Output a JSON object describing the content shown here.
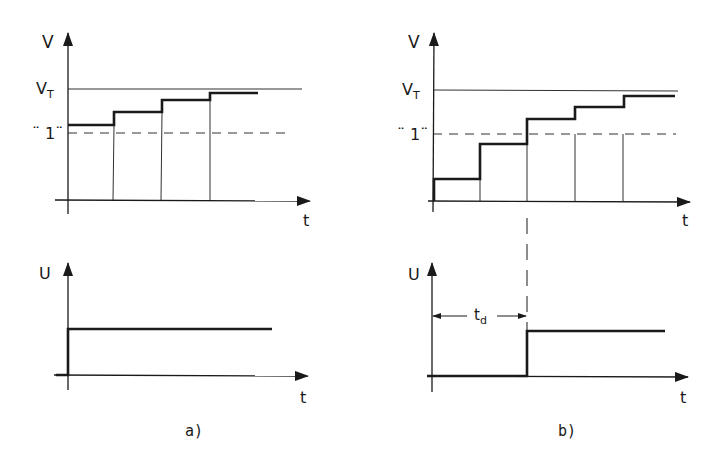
{
  "figure": {
    "caption_a": "a)",
    "caption_b": "b)"
  },
  "panel_a": {
    "top": {
      "y_axis_label": "V",
      "x_axis_label": "t",
      "threshold_label": "V",
      "threshold_sub": "T",
      "logic_level_label": "¨ 1¨",
      "steps": [
        {
          "x_start": 68,
          "x_end": 114,
          "level": 125
        },
        {
          "x_start": 114,
          "x_end": 162,
          "level": 112
        },
        {
          "x_start": 162,
          "x_end": 210,
          "level": 100
        },
        {
          "x_start": 210,
          "x_end": 258,
          "level": 93
        }
      ]
    },
    "bottom": {
      "y_axis_label": "U",
      "x_axis_label": "t"
    }
  },
  "panel_b": {
    "top": {
      "y_axis_label": "V",
      "x_axis_label": "t",
      "threshold_label": "V",
      "threshold_sub": "T",
      "logic_level_label": "¨ 1¨",
      "steps": [
        {
          "x_start": 433,
          "x_end": 480,
          "level": 179
        },
        {
          "x_start": 480,
          "x_end": 527,
          "level": 144
        },
        {
          "x_start": 527,
          "x_end": 575,
          "level": 119
        },
        {
          "x_start": 575,
          "x_end": 624,
          "level": 107
        },
        {
          "x_start": 624,
          "x_end": 675,
          "level": 96
        }
      ]
    },
    "bottom": {
      "y_axis_label": "U",
      "x_axis_label": "t",
      "delay_label": "t",
      "delay_sub": "d"
    }
  },
  "colors": {
    "ink": "#1a1a1a",
    "background": "#ffffff"
  }
}
